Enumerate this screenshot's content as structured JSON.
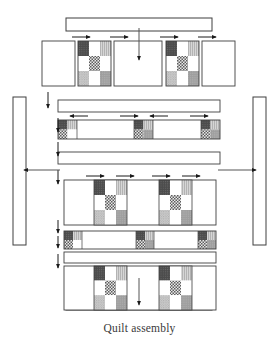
{
  "figure": {
    "caption": "Quilt assembly",
    "type": "quilt-assembly-diagram",
    "canvas": {
      "width": 279,
      "height": 347
    }
  },
  "colors": {
    "outline": "#3f3f3f",
    "background": "#ffffff",
    "plain_patch": "#ffffff",
    "dark_patch": "#4a4a4a",
    "light_gray_patch": "#cfcfcf",
    "medium_gray_patch": "#9b9b9b",
    "textured_patch": "#c4c4c4",
    "checker_dark": "#6e6e6e",
    "arrow": "#1a1a1a",
    "caption_text": "#3a3a3a"
  },
  "legend_note": {
    "block_type": "nine-patch",
    "sashing_unit": "four-patch cornerstone",
    "arrow_meaning": "pressing direction"
  },
  "borders": {
    "top": {
      "label": "top-border-strip",
      "x": 66,
      "y": 18,
      "w": 146,
      "h": 13
    },
    "bottom": {
      "label": "bottom-border-strip",
      "x": 66,
      "y": 297,
      "w": 146,
      "h": 13
    },
    "left": {
      "label": "left-border-strip",
      "x": 13,
      "y": 97,
      "w": 13,
      "h": 148
    },
    "right": {
      "label": "right-border-strip",
      "x": 253,
      "y": 97,
      "w": 13,
      "h": 148
    }
  },
  "rows": [
    {
      "name": "top-block-row",
      "kind": "block-row",
      "y": 41,
      "h": 45,
      "cells": [
        {
          "type": "plain",
          "x": 42,
          "w": 33
        },
        {
          "type": "ninepatch",
          "x": 78,
          "w": 33
        },
        {
          "type": "plain",
          "x": 114,
          "w": 33
        },
        {
          "type": "ninepatch",
          "x": 166,
          "w": 33
        },
        {
          "type": "plain",
          "x": 202,
          "w": 33
        }
      ]
    },
    {
      "name": "upper-sashing-strip",
      "kind": "sashing-plain",
      "x": 58,
      "y": 100,
      "w": 162,
      "h": 12
    },
    {
      "name": "cornerstone-sashing-row-upper",
      "kind": "sashing-with-cornerstones",
      "x": 58,
      "y": 120,
      "w": 162,
      "h": 19,
      "cornerstones": [
        {
          "x": 58,
          "w": 19
        },
        {
          "x": 134,
          "w": 19
        },
        {
          "x": 201,
          "w": 19
        }
      ]
    },
    {
      "name": "middle-sashing-strip",
      "kind": "sashing-plain",
      "x": 58,
      "y": 152,
      "w": 162,
      "h": 12
    },
    {
      "name": "middle-block-row",
      "kind": "block-row-large",
      "x": 64,
      "y": 180,
      "w": 152,
      "h": 45,
      "cells": [
        {
          "type": "plain",
          "x": 64,
          "w": 30
        },
        {
          "type": "ninepatch",
          "x": 94,
          "w": 33
        },
        {
          "type": "plain",
          "x": 127,
          "w": 32
        },
        {
          "type": "ninepatch",
          "x": 159,
          "w": 33
        },
        {
          "type": "plain",
          "x": 192,
          "w": 24
        }
      ]
    },
    {
      "name": "cornerstone-sashing-row-lower",
      "kind": "sashing-with-cornerstones",
      "x": 64,
      "y": 231,
      "w": 152,
      "h": 18,
      "cornerstones": [
        {
          "x": 64,
          "w": 18
        },
        {
          "x": 136,
          "w": 18
        },
        {
          "x": 198,
          "w": 18
        }
      ]
    },
    {
      "name": "lower-sashing-strip",
      "kind": "sashing-plain",
      "x": 64,
      "y": 252,
      "w": 152,
      "h": 11
    },
    {
      "name": "bottom-block-row",
      "kind": "block-row-large",
      "x": 64,
      "y": 266,
      "w": 152,
      "h": 44,
      "cells": [
        {
          "type": "plain",
          "x": 64,
          "w": 30
        },
        {
          "type": "ninepatch",
          "x": 94,
          "w": 33
        },
        {
          "type": "plain",
          "x": 127,
          "w": 32
        },
        {
          "type": "ninepatch",
          "x": 159,
          "w": 33
        },
        {
          "type": "plain",
          "x": 192,
          "w": 24
        }
      ]
    }
  ],
  "arrows": {
    "press_right_top": [
      {
        "x1": 72,
        "x2": 90,
        "y": 37
      },
      {
        "x1": 110,
        "x2": 128,
        "y": 37
      },
      {
        "x1": 160,
        "x2": 178,
        "y": 37
      },
      {
        "x1": 198,
        "x2": 216,
        "y": 37
      }
    ],
    "press_sashing_upper": [
      {
        "x1": 88,
        "x2": 70,
        "y": 116
      },
      {
        "x1": 120,
        "x2": 138,
        "y": 116
      },
      {
        "x1": 168,
        "x2": 150,
        "y": 116
      },
      {
        "x1": 190,
        "x2": 208,
        "y": 116
      }
    ],
    "press_middle_row": [
      {
        "x1": 86,
        "x2": 104,
        "y": 176
      },
      {
        "x1": 116,
        "x2": 134,
        "y": 176
      },
      {
        "x1": 152,
        "x2": 170,
        "y": 176
      },
      {
        "x1": 182,
        "x2": 200,
        "y": 176
      }
    ],
    "vertical_left": [
      {
        "x": 48,
        "y1": 92,
        "y2": 108
      },
      {
        "x": 58,
        "y1": 118,
        "y2": 134
      },
      {
        "x": 58,
        "y1": 142,
        "y2": 158
      },
      {
        "x": 58,
        "y1": 170,
        "y2": 186
      },
      {
        "x": 58,
        "y1": 222,
        "y2": 238
      },
      {
        "x": 58,
        "y1": 236,
        "y2": 250
      },
      {
        "x": 58,
        "y1": 256,
        "y2": 270
      }
    ],
    "join_top_border": {
      "x": 139,
      "y1": 28,
      "y2": 60
    },
    "join_bottom_border": {
      "x": 139,
      "y1": 278,
      "y2": 306
    },
    "join_left_border": {
      "x1": 60,
      "x2": 22,
      "y": 170
    },
    "join_right_border": {
      "x1": 218,
      "x2": 258,
      "y": 170
    }
  }
}
